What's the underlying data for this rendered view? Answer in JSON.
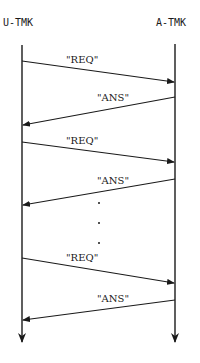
{
  "diagram": {
    "type": "sequence",
    "participants": [
      {
        "id": "left",
        "label": "U-TMK"
      },
      {
        "id": "right",
        "label": "A-TMK"
      }
    ],
    "messages": [
      {
        "from": "U-TMK",
        "to": "A-TMK",
        "label": "\"REQ\""
      },
      {
        "from": "A-TMK",
        "to": "U-TMK",
        "label": "\"ANS\""
      },
      {
        "from": "U-TMK",
        "to": "A-TMK",
        "label": "\"REQ\""
      },
      {
        "from": "A-TMK",
        "to": "U-TMK",
        "label": "\"ANS\""
      },
      {
        "from": "U-TMK",
        "to": "A-TMK",
        "label": "\"REQ\""
      },
      {
        "from": "A-TMK",
        "to": "U-TMK",
        "label": "\"ANS\""
      }
    ],
    "ellipsis": "vertical dots indicating repetition between 2nd and 3rd exchanges",
    "colors": {
      "line": "#1a1a1a",
      "background": "#ffffff"
    }
  }
}
